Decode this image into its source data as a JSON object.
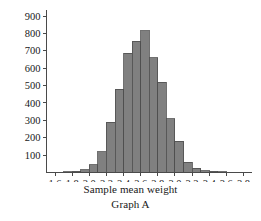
{
  "figure": {
    "xlabel": "Sample mean weight",
    "caption": "Graph A"
  },
  "colors": {
    "bar_fill": "#808080",
    "bar_stroke": "#4d4d4d",
    "axis": "#4a4a4a",
    "text": "#181818",
    "background": "#ffffff"
  },
  "chart_data": {
    "type": "bar",
    "title": "",
    "subtitle": "",
    "xlabel": "Sample mean weight",
    "ylabel": "",
    "annotations": [
      "Graph A"
    ],
    "grid": false,
    "legend": null,
    "xlim": [
      1.5,
      3.9
    ],
    "ylim": [
      0,
      900
    ],
    "bin_width": 0.1,
    "xticks": [
      "1.6",
      "1.8",
      "2.0",
      "2.2",
      "2.4",
      "2.6",
      "2.8",
      "3.0",
      "3.2",
      "3.4",
      "3.6",
      "3.8"
    ],
    "xtick_values": [
      1.6,
      1.8,
      2.0,
      2.2,
      2.4,
      2.6,
      2.8,
      3.0,
      3.2,
      3.4,
      3.6,
      3.8
    ],
    "yticks": [
      "100",
      "200",
      "300",
      "400",
      "500",
      "600",
      "700",
      "800",
      "900"
    ],
    "ytick_values": [
      100,
      200,
      300,
      400,
      500,
      600,
      700,
      800,
      900
    ],
    "bin_centers": [
      1.75,
      1.85,
      1.95,
      2.05,
      2.15,
      2.25,
      2.35,
      2.45,
      2.55,
      2.65,
      2.75,
      2.85,
      2.95,
      3.05,
      3.15,
      3.25,
      3.35,
      3.45,
      3.55
    ],
    "values": [
      5,
      8,
      15,
      45,
      120,
      290,
      480,
      685,
      755,
      815,
      660,
      520,
      310,
      180,
      60,
      25,
      10,
      6,
      4
    ]
  }
}
